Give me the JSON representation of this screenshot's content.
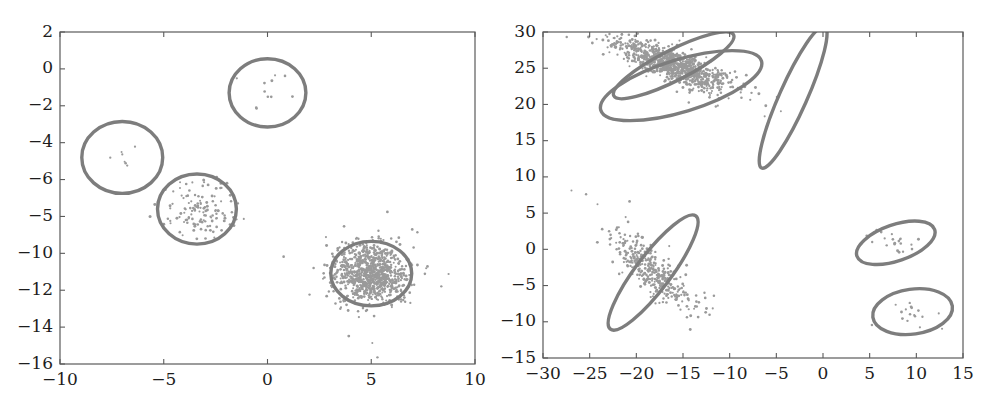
{
  "figure": {
    "background": "#ffffff",
    "ellipse_color": "#7d7d7d",
    "point_color": "#9a9a9a",
    "axis_color": "#5a5a5a",
    "text_color": "#1d1d1d"
  },
  "chart_data": [
    {
      "type": "scatter",
      "name": "left-panel",
      "title": "",
      "xlabel": "",
      "ylabel": "",
      "xlim": [
        -10,
        10
      ],
      "ylim": [
        -16,
        2
      ],
      "grid": false,
      "legend": "none",
      "xticks": [
        -10,
        -5,
        0,
        5,
        10
      ],
      "xticklabels": [
        "-10",
        "-5",
        "0",
        "5",
        "10"
      ],
      "yticks": [
        2,
        0,
        -2,
        -4,
        -6,
        -8,
        -10,
        -12,
        -14,
        -16
      ],
      "yticklabels": [
        "2",
        "0",
        "-2",
        "-4",
        "-6",
        "-5",
        "-10",
        "-12",
        "-14",
        "-16"
      ],
      "clusters": [
        {
          "id": "top-circle",
          "cx": 0.0,
          "cy": -1.3,
          "rx": 1.85,
          "ry": 1.85,
          "angle": 0,
          "n_points": 9,
          "spread": 0.6,
          "outliers": 3
        },
        {
          "id": "upper-left-circle",
          "cx": -7.0,
          "cy": -4.8,
          "rx": 1.95,
          "ry": 1.95,
          "angle": 0,
          "n_points": 6,
          "spread": 0.55,
          "outliers": 2
        },
        {
          "id": "mid-left-circle",
          "cx": -3.4,
          "cy": -7.6,
          "rx": 1.9,
          "ry": 1.9,
          "angle": 0,
          "n_points": 120,
          "spread": 0.78,
          "outliers": 8
        },
        {
          "id": "dense-circle",
          "cx": 5.0,
          "cy": -11.1,
          "rx": 1.95,
          "ry": 1.75,
          "angle": 0,
          "n_points": 900,
          "spread": 0.8,
          "outliers": 60
        }
      ]
    },
    {
      "type": "scatter",
      "name": "right-panel",
      "title": "",
      "xlabel": "",
      "ylabel": "",
      "xlim": [
        -30,
        15
      ],
      "ylim": [
        -15,
        30
      ],
      "grid": false,
      "legend": "none",
      "xticks": [
        -30,
        -25,
        -20,
        -15,
        -10,
        -5,
        0,
        5,
        10,
        15
      ],
      "xticklabels": [
        "-30",
        "-25",
        "-20",
        "-15",
        "-10",
        "-5",
        "0",
        "5",
        "10",
        "15"
      ],
      "yticks": [
        30,
        25,
        20,
        15,
        10,
        5,
        0,
        -5,
        -10,
        -15
      ],
      "yticklabels": [
        "30",
        "25",
        "20",
        "15",
        "10",
        "5",
        "0",
        "-5",
        "-10",
        "-15"
      ],
      "clusters": [
        {
          "id": "top-narrow-dense",
          "cx": -16.0,
          "cy": 25.4,
          "rx": 7.2,
          "ry": 2.1,
          "angle": -27,
          "n_points": 900,
          "spread": 0.82,
          "outliers": 55
        },
        {
          "id": "top-wide-empty",
          "cx": -15.2,
          "cy": 22.6,
          "rx": 9.0,
          "ry": 3.6,
          "angle": -17,
          "n_points": 0,
          "spread": 0.0,
          "outliers": 0
        },
        {
          "id": "mid-narrow-empty",
          "cx": -3.2,
          "cy": 21.0,
          "rx": 8.3,
          "ry": 1.9,
          "angle": -66,
          "n_points": 0,
          "spread": 0.0,
          "outliers": 0
        },
        {
          "id": "lower-left-dense",
          "cx": -18.2,
          "cy": -3.2,
          "rx": 7.6,
          "ry": 2.4,
          "angle": -53,
          "n_points": 330,
          "spread": 0.82,
          "outliers": 28
        },
        {
          "id": "right-upper",
          "cx": 7.8,
          "cy": 0.9,
          "rx": 4.4,
          "ry": 2.5,
          "angle": -19,
          "n_points": 18,
          "spread": 0.6,
          "outliers": 3
        },
        {
          "id": "right-lower",
          "cx": 9.6,
          "cy": -8.6,
          "rx": 4.3,
          "ry": 3.1,
          "angle": -8,
          "n_points": 14,
          "spread": 0.58,
          "outliers": 3
        }
      ]
    }
  ]
}
